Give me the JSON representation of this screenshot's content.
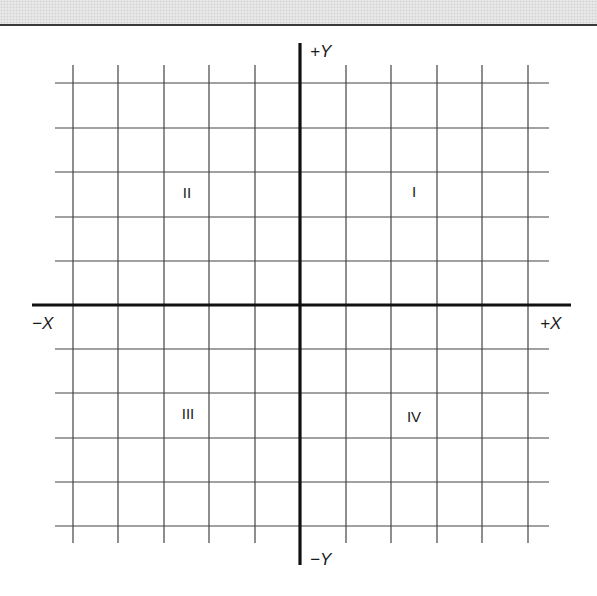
{
  "figure": {
    "axes": {
      "x_positive_label": "+X",
      "x_negative_label": "−X",
      "y_positive_label": "+Y",
      "y_negative_label": "−Y"
    },
    "quadrants": [
      {
        "id": "I",
        "label": "I",
        "position": "upper-right"
      },
      {
        "id": "II",
        "label": "II",
        "position": "upper-left"
      },
      {
        "id": "III",
        "label": "III",
        "position": "lower-left"
      },
      {
        "id": "IV",
        "label": "IV",
        "position": "lower-right"
      }
    ],
    "grid": {
      "columns_each_side": 5,
      "rows_each_side": 5,
      "vertical_lines_x": [
        73,
        118,
        164,
        209,
        255,
        346,
        391,
        437,
        482,
        528
      ],
      "horizontal_lines_y": [
        83,
        128,
        172,
        217,
        261,
        349,
        393,
        438,
        482,
        526
      ],
      "vertical_extent_y": [
        65,
        543
      ],
      "horizontal_extent_x": [
        55,
        549
      ],
      "line_color": "#444444"
    },
    "axis_lines": {
      "x_axis": {
        "y": 305,
        "x_start": 32,
        "x_end": 571
      },
      "y_axis": {
        "x": 300,
        "y_start": 43,
        "y_end": 565
      },
      "color": "#111111"
    },
    "header_band_color": "#e2e2e2"
  }
}
